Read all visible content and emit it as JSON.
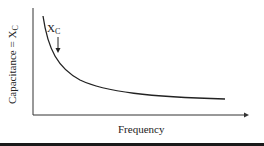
{
  "diagram": {
    "x_axis_label": "Frequency",
    "y_axis_label_main": "Capacitance = X",
    "y_axis_label_sub": "C",
    "annotation_main": "X",
    "annotation_sub": "C",
    "curve": "inverse relationship (hyperbolic decay)",
    "colors": {
      "line": "#222222",
      "background": "#ffffff",
      "bottom_bar": "#1a1a1a"
    }
  }
}
